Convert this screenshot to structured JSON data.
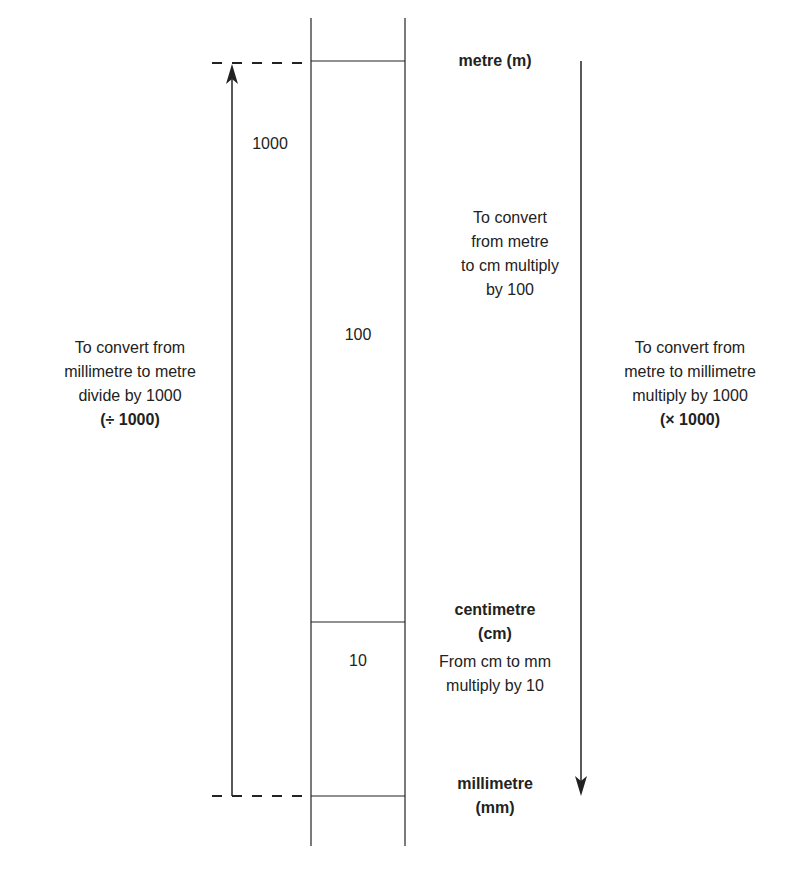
{
  "units": {
    "metre": "metre (m)",
    "centimetre_line1": "centimetre",
    "centimetre_line2": "(cm)",
    "millimetre_line1": "millimetre",
    "millimetre_line2": "(mm)"
  },
  "column_values": {
    "m_to_mm": "1000",
    "m_to_cm": "100",
    "cm_to_mm": "10"
  },
  "left_note": {
    "lines": [
      "To convert from",
      "millimetre to metre",
      "divide by 1000"
    ],
    "operation": "(÷ 1000)"
  },
  "right_note": {
    "lines": [
      "To convert from",
      "metre to millimetre",
      "multiply by 1000"
    ],
    "operation": "(× 1000)"
  },
  "middle_note": {
    "lines": [
      "To convert",
      "from metre",
      "to cm multiply",
      "by 100"
    ]
  },
  "cm_note": {
    "lines": [
      "From cm to mm",
      "multiply by 10"
    ]
  },
  "colors": {
    "line": "#222222",
    "background": "#ffffff"
  }
}
